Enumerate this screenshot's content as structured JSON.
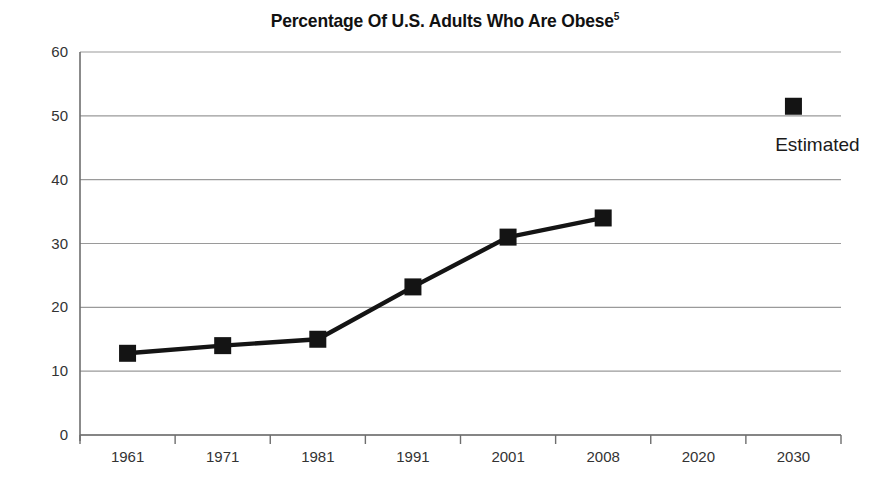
{
  "chart_data": {
    "type": "line",
    "title": "Percentage Of U.S. Adults Who Are Obese",
    "title_superscript": "5",
    "xlabel": "",
    "ylabel": "",
    "categories": [
      "1961",
      "1971",
      "1981",
      "1991",
      "2001",
      "2008",
      "2020",
      "2030"
    ],
    "series": [
      {
        "name": "Observed",
        "values": [
          12.8,
          14.0,
          15.0,
          23.2,
          31.0,
          34.0,
          null,
          null
        ],
        "marker": "square",
        "color": "#141414",
        "connected": true
      },
      {
        "name": "Estimated",
        "values": [
          null,
          null,
          null,
          null,
          null,
          null,
          null,
          51.5
        ],
        "marker": "square",
        "color": "#141414",
        "connected": false
      }
    ],
    "ylim": [
      0,
      60
    ],
    "yticks": [
      "0",
      "10",
      "20",
      "30",
      "40",
      "50",
      "60"
    ],
    "ytick_values": [
      0,
      10,
      20,
      30,
      40,
      50,
      60
    ],
    "grid": true,
    "grid_axis": "y",
    "legend": "none",
    "annotations": [
      {
        "text": "Estimated",
        "category": "2030",
        "value": 44.5
      }
    ]
  },
  "axes": {
    "y_axis_name": "percentage-axis",
    "x_axis_name": "year-axis"
  },
  "colors": {
    "background": "#ffffff",
    "series": "#141414",
    "grid": "#9a9a9a",
    "axis": "#6e6e6e",
    "text": "#1a1a1a"
  }
}
